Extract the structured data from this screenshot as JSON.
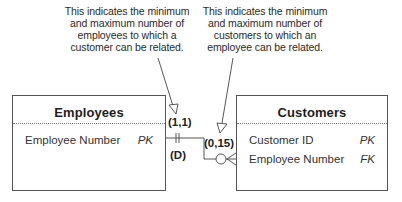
{
  "annotations": {
    "left": {
      "lines": [
        "This indicates the minimum",
        "and maximum number of",
        "employees to which a",
        "customer can be related."
      ]
    },
    "right": {
      "lines": [
        "This indicates the minimum",
        "and maximum number of",
        "customers to which an",
        "employee can be related."
      ]
    }
  },
  "entities": {
    "employees": {
      "title": "Employees",
      "attributes": [
        {
          "name": "Employee Number",
          "key": "PK"
        }
      ]
    },
    "customers": {
      "title": "Customers",
      "attributes": [
        {
          "name": "Customer ID",
          "key": "PK"
        },
        {
          "name": "Employee Number",
          "key": "FK"
        }
      ]
    }
  },
  "relationship": {
    "employee_side_cardinality": "(1,1)",
    "employee_side_participation": "(D)",
    "customer_side_cardinality": "(0,15)",
    "employee_side_symbol": "one-and-only-one",
    "customer_side_symbol": "zero-or-many"
  },
  "colors": {
    "line": "#444444",
    "text": "#222222",
    "background": "#ffffff"
  }
}
